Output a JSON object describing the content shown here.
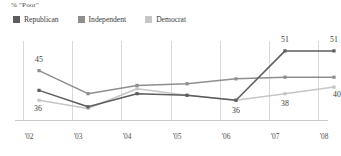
{
  "chart_data": {
    "type": "line",
    "title": "% \"Poor\"",
    "xlabel": "",
    "ylabel": "",
    "grid": "vertical",
    "legend_position": "top-left",
    "ylim": [
      30,
      54
    ],
    "categories": [
      "'02",
      "'03",
      "'04",
      "'05",
      "'06",
      "'07",
      "'08"
    ],
    "series": [
      {
        "name": "Republican",
        "color": "#5d5d5d",
        "values": [
          39,
          34,
          38,
          37.5,
          36,
          51,
          51
        ],
        "labels": [
          null,
          null,
          null,
          null,
          "36",
          "51",
          "51"
        ]
      },
      {
        "name": "Independent",
        "color": "#8e8e8e",
        "values": [
          45,
          38,
          40.5,
          41,
          42.5,
          43,
          43
        ],
        "labels": [
          "45",
          null,
          null,
          null,
          null,
          null,
          null
        ]
      },
      {
        "name": "Democrat",
        "color": "#c6c6c6",
        "values": [
          36,
          33.5,
          39.5,
          37.5,
          36,
          38,
          40
        ],
        "labels": [
          "36",
          null,
          null,
          null,
          null,
          "38",
          "40"
        ]
      }
    ]
  },
  "legend": {
    "items": [
      {
        "label": "Republican",
        "color": "#5d5d5d"
      },
      {
        "label": "Independent",
        "color": "#8e8e8e"
      },
      {
        "label": "Democrat",
        "color": "#c6c6c6"
      }
    ]
  },
  "axis": {
    "ticks": [
      "'02",
      "'03",
      "'04",
      "'05",
      "'06",
      "'07",
      "'08"
    ]
  }
}
